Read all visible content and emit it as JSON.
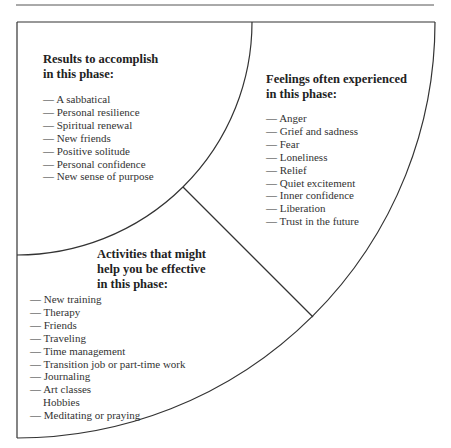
{
  "figure": {
    "sections": {
      "results": {
        "heading_line1": "Results to accomplish",
        "heading_line2": "in this phase:",
        "items": [
          "— A sabbatical",
          "— Personal resilience",
          "— Spiritual renewal",
          "— New friends",
          "— Positive solitude",
          "— Personal confidence",
          "— New sense of purpose"
        ]
      },
      "feelings": {
        "heading_line1": "Feelings often experienced",
        "heading_line2": "in this phase:",
        "items": [
          "— Anger",
          "— Grief and sadness",
          "— Fear",
          "— Loneliness",
          "— Relief",
          "— Quiet excitement",
          "— Inner confidence",
          "— Liberation",
          "— Trust in the future"
        ]
      },
      "activities": {
        "heading_line1": "Activities that might",
        "heading_line2": "help you be effective",
        "heading_line3": "in this phase:",
        "items": [
          "— New training",
          "— Therapy",
          "— Friends",
          "— Traveling",
          "— Time management",
          "— Transition job or part-time work",
          "— Journaling",
          "— Art classes",
          "Hobbies",
          "— Meditating or praying"
        ]
      }
    },
    "colors": {
      "line": "#333333",
      "text": "#2a2a2a"
    }
  }
}
